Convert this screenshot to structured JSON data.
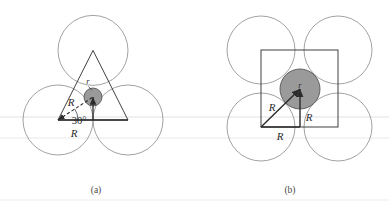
{
  "figure": {
    "background_color": "#ffffff",
    "outline_color": "#8a8a8a",
    "stroke_color": "#2b2b2b",
    "shade_fill": "#9a9a9a",
    "shade_stroke": "#4a4a4a",
    "scanline_color": "#efeff1",
    "panels": [
      {
        "id": "panel-a",
        "caption": "(a)",
        "caption_x": 96,
        "caption_y": 192,
        "arrangement": "triangular",
        "big_circle_radius": 35,
        "big_circles": [
          {
            "name": "top-circle",
            "cx": 93,
            "cy": 50.4,
            "r": 35
          },
          {
            "name": "bottom-left-circle",
            "cx": 58,
            "cy": 120,
            "r": 35
          },
          {
            "name": "bottom-right-circle",
            "cx": 128,
            "cy": 120,
            "r": 35
          }
        ],
        "triangle_points": "93,50.4 58,120 128,120",
        "interstitial": {
          "name": "interstitial-circle",
          "cx": 93,
          "cy": 97,
          "r": 9
        },
        "labels": {
          "small_radius": "r",
          "radius_diagonal": "R",
          "radius_base": "R",
          "angle": "30°"
        },
        "label_positions": {
          "small_radius": {
            "x": 88,
            "y": 84
          },
          "radius_diagonal": {
            "x": 71,
            "y": 106
          },
          "radius_base": {
            "x": 74,
            "y": 137
          },
          "angle": {
            "x": 79,
            "y": 123
          }
        },
        "leader_line": {
          "x1": 88,
          "y1": 86,
          "x2": 92,
          "y2": 90
        },
        "dashed_segment": {
          "x1": 58,
          "y1": 120,
          "x2": 93,
          "y2": 97
        },
        "base_segment": {
          "x1": 58,
          "y1": 120,
          "x2": 128,
          "y2": 120
        },
        "vertical_segment": {
          "x1": 93,
          "y1": 120,
          "x2": 93,
          "y2": 97
        },
        "angle_arc": {
          "cx": 58,
          "cy": 120,
          "r": 20
        }
      },
      {
        "id": "panel-b",
        "caption": "(b)",
        "caption_x": 290,
        "caption_y": 192,
        "arrangement": "square",
        "big_circle_radius": 34,
        "big_circles": [
          {
            "name": "top-left-circle",
            "cx": 261,
            "cy": 50,
            "r": 34
          },
          {
            "name": "top-right-circle",
            "cx": 338,
            "cy": 50,
            "r": 34
          },
          {
            "name": "bottom-left-circle",
            "cx": 261,
            "cy": 127,
            "r": 34
          },
          {
            "name": "bottom-right-circle",
            "cx": 338,
            "cy": 127,
            "r": 34
          }
        ],
        "square_rect": {
          "x": 261,
          "y": 50,
          "w": 77,
          "h": 77
        },
        "interstitial": {
          "name": "interstitial-circle",
          "cx": 300,
          "cy": 89,
          "r": 20
        },
        "labels": {
          "small_radius": "r",
          "radius_diagonal": "R",
          "radius_vertical": "R",
          "radius_base": "R"
        },
        "label_positions": {
          "small_radius": {
            "x": 297,
            "y": 87
          },
          "radius_diagonal": {
            "x": 272,
            "y": 110
          },
          "radius_vertical": {
            "x": 306,
            "y": 120
          },
          "radius_base": {
            "x": 280,
            "y": 139
          }
        },
        "diagonal_arrow": {
          "x1": 261,
          "y1": 127,
          "x2": 300,
          "y2": 89
        },
        "vertical_arrow": {
          "x1": 300,
          "y1": 127,
          "x2": 300,
          "y2": 89
        },
        "base_arrow": {
          "x1": 261,
          "y1": 127,
          "x2": 300,
          "y2": 127
        }
      }
    ]
  }
}
